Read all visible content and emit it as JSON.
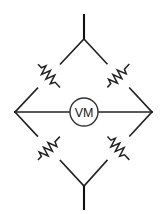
{
  "diagram": {
    "background_color": "#ffffff",
    "wire_color": "#222222",
    "meter": {
      "label": "VM",
      "name": "voltmeter",
      "shape": "circle",
      "center": {
        "x": 84,
        "y": 112
      },
      "radius": 14
    },
    "nodes": {
      "top": {
        "x": 84,
        "y": 39
      },
      "left": {
        "x": 15,
        "y": 112
      },
      "right": {
        "x": 152,
        "y": 112
      },
      "bottom": {
        "x": 84,
        "y": 186
      }
    },
    "terminals": [
      {
        "name": "top-terminal",
        "x1": 84,
        "y1": 14,
        "x2": 84,
        "y2": 39
      },
      {
        "name": "bottom-terminal",
        "x1": 84,
        "y1": 186,
        "x2": 84,
        "y2": 210
      }
    ],
    "arms": [
      {
        "name": "top-left-arm",
        "from": "top",
        "to": "left",
        "has_resistor": true
      },
      {
        "name": "top-right-arm",
        "from": "top",
        "to": "right",
        "has_resistor": true
      },
      {
        "name": "bottom-left-arm",
        "from": "left",
        "to": "bottom",
        "has_resistor": true
      },
      {
        "name": "bottom-right-arm",
        "from": "right",
        "to": "bottom",
        "has_resistor": true
      }
    ],
    "bridge": {
      "name": "bridge-branch",
      "from": "left",
      "to": "right",
      "contains_meter": true
    },
    "resistors": [
      {
        "name": "resistor-top-left",
        "center": {
          "x": 49,
          "y": 75
        },
        "angle_deg": 46.6
      },
      {
        "name": "resistor-top-right",
        "center": {
          "x": 118,
          "y": 75
        },
        "angle_deg": -46.8
      },
      {
        "name": "resistor-bottom-left",
        "center": {
          "x": 49,
          "y": 149
        },
        "angle_deg": -46.9
      },
      {
        "name": "resistor-bottom-right",
        "center": {
          "x": 118,
          "y": 149
        },
        "angle_deg": 46.9
      }
    ]
  }
}
